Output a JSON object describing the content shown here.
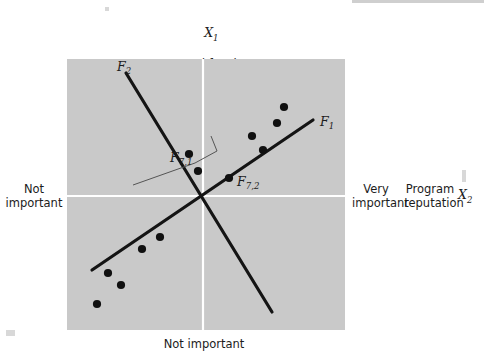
{
  "figure": {
    "title_top": "X₁\nGood faculty\nVery important",
    "top_axis_variable": "X",
    "top_axis_subscript": "1",
    "top_attribute": "Good faculty",
    "top_anchor": "Very important",
    "left_anchor": "Not\nimportant",
    "bottom_anchor": "Not important",
    "right_anchor": "Very\nimportant",
    "right_attribute": "Program\nreputation",
    "right_axis_variable": "X",
    "right_axis_subscript": "2",
    "factor1_label": "F",
    "factor1_subscript": "1",
    "factor2_label": "F",
    "factor2_subscript": "2",
    "loading1_label": "F",
    "loading1_subscript": "7,1",
    "loading2_label": "F",
    "loading2_subscript": "7,2"
  },
  "colors": {
    "plot_background": "#c9c9c9",
    "axis_line": "#ffffff",
    "factor_line": "#141414",
    "point_fill": "#101010",
    "projection_line": "#555555",
    "text": "#1c1c1c",
    "page_background": "#ffffff"
  },
  "chart_data": {
    "type": "scatter",
    "xlabel": "Program reputation (X2)",
    "ylabel": "Good faculty (X1)",
    "xlim": [
      0,
      278
    ],
    "ylim": [
      0,
      271
    ],
    "grid": false,
    "legend_position": "none",
    "axes": {
      "horizontal_axis_y": 137,
      "vertical_axis_x": 136
    },
    "points": [
      {
        "id": "p1",
        "x": 41,
        "y": 214
      },
      {
        "id": "p2",
        "x": 54,
        "y": 226
      },
      {
        "id": "p3",
        "x": 30,
        "y": 245
      },
      {
        "id": "p4",
        "x": 75,
        "y": 190
      },
      {
        "id": "p5",
        "x": 93,
        "y": 178
      },
      {
        "id": "p6",
        "x": 122,
        "y": 95
      },
      {
        "id": "p7",
        "x": 131,
        "y": 112,
        "label": "F7,1"
      },
      {
        "id": "p8",
        "x": 162,
        "y": 119,
        "label": "F7,2"
      },
      {
        "id": "p9",
        "x": 185,
        "y": 77
      },
      {
        "id": "p10",
        "x": 196,
        "y": 91
      },
      {
        "id": "p11",
        "x": 210,
        "y": 64
      },
      {
        "id": "p12",
        "x": 217,
        "y": 48
      }
    ],
    "lines": [
      {
        "name": "F1",
        "kind": "factor-axis",
        "x1": 25,
        "y1": 211,
        "x2": 246,
        "y2": 61,
        "label": "F1",
        "label_x": 253,
        "label_y": 63
      },
      {
        "name": "F2",
        "kind": "factor-axis",
        "x1": 59,
        "y1": 14,
        "x2": 205,
        "y2": 253,
        "label": "F2",
        "label_x": 50,
        "label_y": 8
      }
    ],
    "projection": {
      "description": "bracket from F7,1 to the F1 axis",
      "points": [
        [
          66,
          126
        ],
        [
          128,
          104
        ],
        [
          150,
          92
        ],
        [
          144,
          77
        ]
      ]
    }
  }
}
